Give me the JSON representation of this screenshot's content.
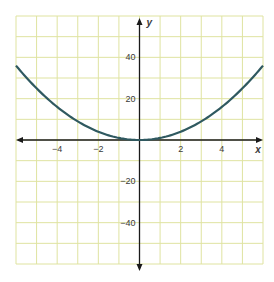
{
  "chart_data": {
    "type": "line",
    "title": "",
    "xlabel": "x",
    "ylabel": "y",
    "xlim": [
      -6,
      6
    ],
    "ylim": [
      -60,
      60
    ],
    "grid": true,
    "x_grid_step": 1,
    "y_grid_step": 10,
    "x_ticks": [
      {
        "value": -4,
        "label": "−4"
      },
      {
        "value": -2,
        "label": "−2"
      },
      {
        "value": 2,
        "label": "2"
      },
      {
        "value": 4,
        "label": "4"
      }
    ],
    "y_ticks": [
      {
        "value": 40,
        "label": "40"
      },
      {
        "value": 20,
        "label": "20"
      },
      {
        "value": -20,
        "label": "−20"
      },
      {
        "value": -40,
        "label": "−40"
      }
    ],
    "series": [
      {
        "name": "y = x^2",
        "x": [
          -6,
          -5,
          -4,
          -3,
          -2,
          -1,
          0,
          1,
          2,
          3,
          4,
          5,
          6
        ],
        "y": [
          36,
          25,
          16,
          9,
          4,
          1,
          0,
          1,
          4,
          9,
          16,
          25,
          36
        ]
      }
    ],
    "legend": null
  },
  "style": {
    "grid_color": "#dfe3a0",
    "axis_color": "#1a1a1a",
    "curve_color": "#2f5960",
    "background": "#ffffff"
  }
}
